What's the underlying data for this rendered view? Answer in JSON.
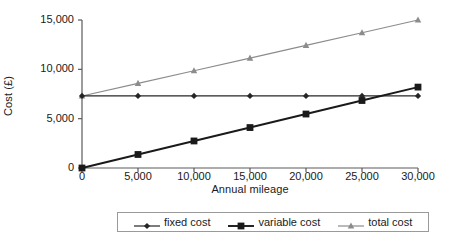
{
  "chart_data": {
    "type": "line",
    "title": "",
    "xlabel": "Annual mileage",
    "ylabel": "Cost (£)",
    "x": [
      0,
      5000,
      10000,
      15000,
      20000,
      25000,
      30000
    ],
    "xlim": [
      0,
      30000
    ],
    "ylim": [
      0,
      15000
    ],
    "xticks": [
      "0",
      "5,000",
      "10,000",
      "15,000",
      "20,000",
      "25,000",
      "30,000"
    ],
    "yticks": [
      "0",
      "5,000",
      "10,000",
      "15,000"
    ],
    "ytick_values": [
      0,
      5000,
      10000,
      15000
    ],
    "grid": false,
    "legend_position": "bottom",
    "series": [
      {
        "name": "fixed cost",
        "marker": "diamond",
        "color": "#262626",
        "values": [
          7300,
          7300,
          7300,
          7300,
          7300,
          7300,
          7300
        ]
      },
      {
        "name": "variable cost",
        "marker": "square",
        "color": "#1a1a1a",
        "values": [
          0,
          1370,
          2740,
          4100,
          5470,
          6840,
          8200
        ]
      },
      {
        "name": "total cost",
        "marker": "triangle",
        "color": "#8c8c8c",
        "values": [
          7300,
          8580,
          9860,
          11140,
          12430,
          13710,
          15000
        ]
      }
    ]
  },
  "axis": {
    "line_color": "#5a5a5a"
  }
}
